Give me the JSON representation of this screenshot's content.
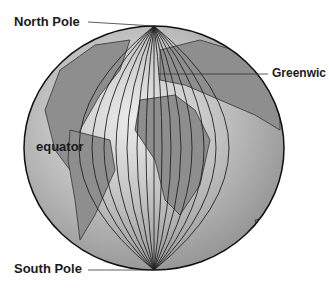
{
  "diagram": {
    "labels": {
      "north_pole": "North Pole",
      "south_pole": "South Pole",
      "greenwich": "Greenwic",
      "equator": "equator"
    },
    "colors": {
      "ocean": "#a8a8a8",
      "land": "#8c8c8c",
      "highlight": "#e6e6e6",
      "lines": "#1a1a1a"
    }
  }
}
